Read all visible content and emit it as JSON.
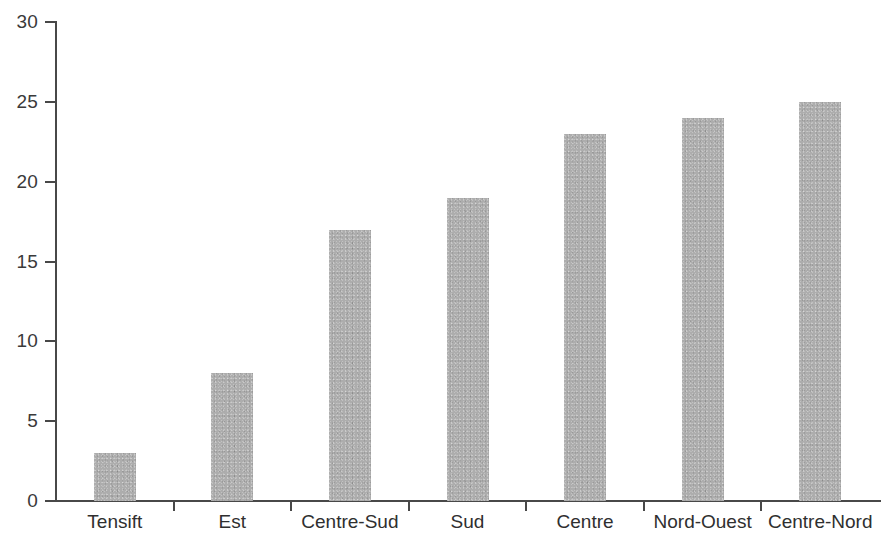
{
  "chart_data": {
    "type": "bar",
    "title": "",
    "subtitle": "",
    "xlabel": "",
    "ylabel": "",
    "categories": [
      "Tensift",
      "Est",
      "Centre-Sud",
      "Sud",
      "Centre",
      "Nord-Ouest",
      "Centre-Nord"
    ],
    "values": [
      3,
      8,
      17,
      19,
      23,
      24,
      25
    ],
    "ylim": [
      0,
      30
    ],
    "yticks": [
      0,
      5,
      10,
      15,
      20,
      25,
      30
    ],
    "ytick_labels": [
      "0",
      "5",
      "10",
      "15",
      "20",
      "25",
      "30"
    ],
    "grid": false,
    "legend": null,
    "legend_position": "none",
    "annotations": [],
    "bar_color": "#adadad",
    "axis_color": "#484848",
    "text_color": "#2f2f2f",
    "background_color": "#ffffff"
  }
}
